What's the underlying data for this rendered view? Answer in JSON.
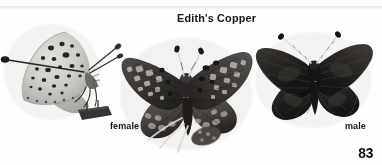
{
  "plate": {
    "title": "Edith's Copper",
    "page_number": "83",
    "background_color": "#fefefe",
    "rule_color": "#e4e4e6",
    "medium": "grayscale-halftone-photograph"
  },
  "labels": {
    "female": "female",
    "male": "male"
  },
  "specimens": [
    {
      "id": "ventral",
      "name": "edith-copper-ventral-view",
      "view": "ventral-side-view",
      "wings_closed": true,
      "description": "Pale gray underside with scattered dark spots, pinned with specimen label block",
      "tone_light": "#d8d6d2",
      "tone_mid": "#b4b2ae",
      "tone_dark": "#2e2c2b",
      "antennae": 2
    },
    {
      "id": "female",
      "name": "edith-copper-female-dorsal",
      "view": "dorsal-spread",
      "wings_closed": false,
      "description": "Dark brown wings with pale checkered spot bands and orange-gray marginal markings",
      "tone_light": "#bcb9b4",
      "tone_mid": "#6d6a66",
      "tone_dark": "#1b1a19",
      "antennae": 2
    },
    {
      "id": "male",
      "name": "edith-copper-male-dorsal",
      "view": "dorsal-spread",
      "wings_closed": false,
      "description": "Uniformly dark sooty brown wings with faint veining, pale striped antennae",
      "tone_light": "#5a5754",
      "tone_mid": "#2c2a29",
      "tone_dark": "#0e0d0d",
      "antennae": 2
    }
  ]
}
